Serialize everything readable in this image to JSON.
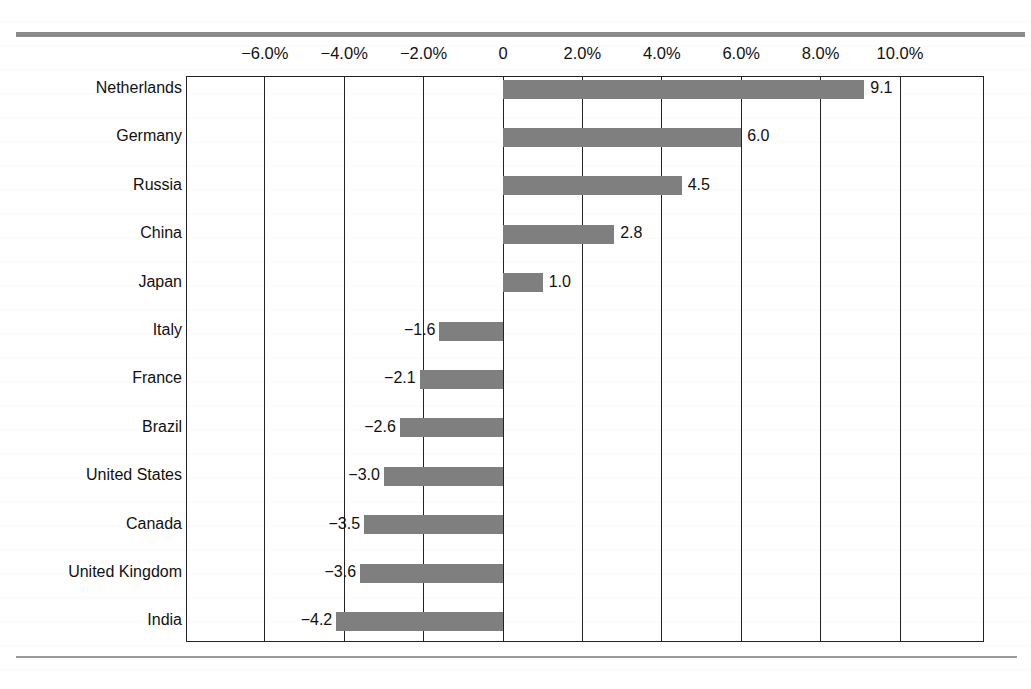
{
  "chart_data": {
    "type": "bar",
    "orientation": "horizontal",
    "title": "",
    "xlabel": "",
    "ylabel": "",
    "xlim": [
      -8.0,
      12.0
    ],
    "grid": true,
    "legend": null,
    "x_ticks": [
      "−6.0%",
      "−4.0%",
      "−2.0%",
      "0",
      "2.0%",
      "4.0%",
      "6.0%",
      "8.0%",
      "10.0%"
    ],
    "x_tick_values": [
      -6.0,
      -4.0,
      -2.0,
      0,
      2.0,
      4.0,
      6.0,
      8.0,
      10.0
    ],
    "categories": [
      "Netherlands",
      "Germany",
      "Russia",
      "China",
      "Japan",
      "Italy",
      "France",
      "Brazil",
      "United States",
      "Canada",
      "United Kingdom",
      "India"
    ],
    "values": [
      9.1,
      6.0,
      4.5,
      2.8,
      1.0,
      -1.6,
      -2.1,
      -2.6,
      -3.0,
      -3.5,
      -3.6,
      -4.2
    ],
    "value_labels": [
      "9.1",
      "6.0",
      "4.5",
      "2.8",
      "1.0",
      "−1.6",
      "−2.1",
      "−2.6",
      "−3.0",
      "−3.5",
      "−3.6",
      "−4.2"
    ],
    "bar_color": "#7f7f7f"
  }
}
